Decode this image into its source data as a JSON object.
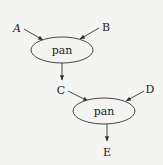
{
  "diagram": {
    "type": "dataflow",
    "nodes": [
      {
        "id": "pan1",
        "label": "pan",
        "cx": 62,
        "cy": 50,
        "rx": 31,
        "ry": 13
      },
      {
        "id": "pan2",
        "label": "pan",
        "cx": 104,
        "cy": 111,
        "rx": 31,
        "ry": 13
      }
    ],
    "inputs": [
      {
        "id": "A",
        "label": "A",
        "x": 17,
        "y": 29
      },
      {
        "id": "B",
        "label": "B",
        "x": 106,
        "y": 29
      },
      {
        "id": "C",
        "label": "C",
        "x": 61,
        "y": 91
      },
      {
        "id": "D",
        "label": "D",
        "x": 150,
        "y": 90
      },
      {
        "id": "E",
        "label": "E",
        "x": 107,
        "y": 153
      }
    ],
    "edges": [
      {
        "from": "A",
        "to": "pan1"
      },
      {
        "from": "B",
        "to": "pan1"
      },
      {
        "from": "pan1",
        "to": "C"
      },
      {
        "from": "C",
        "to": "pan2"
      },
      {
        "from": "D",
        "to": "pan2"
      },
      {
        "from": "pan2",
        "to": "E"
      }
    ]
  },
  "labels": {
    "a": "A",
    "b": "B",
    "c": "C",
    "d": "D",
    "e": "E",
    "pan1": "pan",
    "pan2": "pan"
  }
}
